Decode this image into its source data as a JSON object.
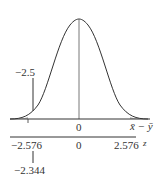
{
  "diagram": {
    "type": "normal-distribution-hypothesis-test",
    "curve": {
      "description": "standard normal bell curve",
      "peak_label": "0"
    },
    "upper_axis": {
      "variable_label": "x̄ − ȳ",
      "center_label": "0",
      "marked_value_label": "−2.5"
    },
    "lower_axis": {
      "variable_label": "z",
      "left_critical_label": "−2.576",
      "center_label": "0",
      "right_critical_label": "2.576",
      "test_statistic_label": "−2.344"
    },
    "colors": {
      "line": "#333333",
      "background": "#ffffff"
    }
  }
}
